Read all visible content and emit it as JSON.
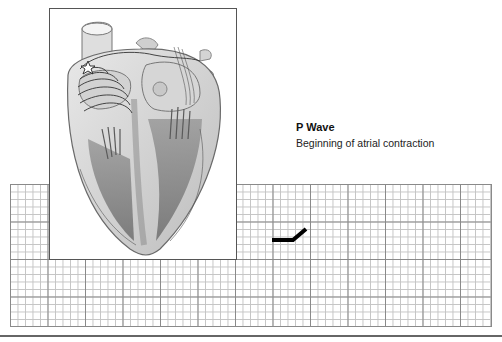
{
  "wave": {
    "title": "P Wave",
    "description": "Beginning of atrial contraction"
  },
  "illustration": {
    "subject": "heart-cross-section",
    "annotations": [
      "sa-node-star-icon",
      "atrial-depolarization-arcs"
    ]
  },
  "ecg_grid": {
    "small_square_px": 7.5,
    "large_square_px": 37.5,
    "trace_color": "#000000",
    "trace_segment": "p-wave-start"
  },
  "colors": {
    "grid_major": "#8a8a8a",
    "grid_minor": "#c4c4c4",
    "frame_border": "#555555",
    "text": "#111111"
  }
}
